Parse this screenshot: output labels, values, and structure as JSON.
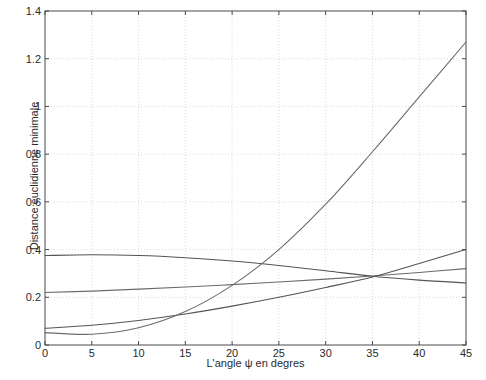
{
  "chart_data": {
    "type": "line",
    "title": "",
    "xlabel": "L'angle ψ en degres",
    "ylabel": "Distance euclidienne minimale",
    "xlim": [
      0,
      45
    ],
    "ylim": [
      0,
      1.4
    ],
    "grid": true,
    "legend": "none",
    "xticks": [
      "0",
      "5",
      "10",
      "15",
      "20",
      "25",
      "30",
      "35",
      "40",
      "45"
    ],
    "xtick_values": [
      0,
      5,
      10,
      15,
      20,
      25,
      30,
      35,
      40,
      45
    ],
    "yticks": [
      "0",
      "0.2",
      "0.4",
      "0.6",
      "0.8",
      "1",
      "1.2",
      "1.4"
    ],
    "ytick_values": [
      0,
      0.2,
      0.4,
      0.6,
      0.8,
      1.0,
      1.2,
      1.4
    ],
    "x": [
      0,
      5,
      10,
      15,
      20,
      25,
      30,
      35,
      40,
      45
    ],
    "series": [
      {
        "name": "curve-1",
        "values": [
          0.375,
          0.378,
          0.375,
          0.366,
          0.352,
          0.333,
          0.311,
          0.288,
          0.272,
          0.26
        ],
        "color": "#545454"
      },
      {
        "name": "curve-2",
        "values": [
          0.22,
          0.226,
          0.234,
          0.243,
          0.253,
          0.264,
          0.276,
          0.289,
          0.304,
          0.32
        ],
        "color": "#6b6b6b"
      },
      {
        "name": "curve-3",
        "values": [
          0.07,
          0.083,
          0.103,
          0.13,
          0.163,
          0.2,
          0.241,
          0.285,
          0.342,
          0.4
        ],
        "color": "#545454"
      },
      {
        "name": "curve-4",
        "values": [
          0.052,
          0.045,
          0.072,
          0.14,
          0.25,
          0.4,
          0.59,
          0.81,
          1.04,
          1.27
        ],
        "color": "#6b6b6b"
      }
    ],
    "axis_color": "#4a4a4a",
    "grid_color": "#cfcfcf",
    "background": "#ffffff"
  },
  "plot": {
    "left_px": 45,
    "right_px": 466,
    "top_px": 11,
    "bottom_px": 345
  }
}
